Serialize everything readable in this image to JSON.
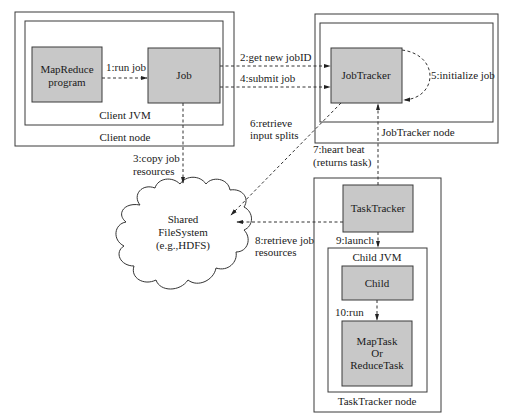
{
  "nodes": {
    "client_node": {
      "label": "Client node"
    },
    "client_jvm": {
      "label": "Client JVM"
    },
    "mapreduce_program": {
      "lines": [
        "MapReduce",
        "program"
      ]
    },
    "job": {
      "label": "Job"
    },
    "jobtracker_node": {
      "label": "JobTracker node"
    },
    "jobtracker": {
      "label": "JobTracker"
    },
    "shared_fs": {
      "lines": [
        "Shared",
        "FileSystem",
        "(e.g.,HDFS)"
      ]
    },
    "tasktracker_node": {
      "label": "TaskTracker node"
    },
    "tasktracker": {
      "label": "TaskTracker"
    },
    "child_jvm": {
      "label": "Child JVM"
    },
    "child": {
      "label": "Child"
    },
    "task": {
      "lines": [
        "MapTask",
        "Or",
        "ReduceTask"
      ]
    }
  },
  "edges": [
    {
      "id": "run-job",
      "from": "mapreduce_program",
      "to": "job",
      "lines": [
        "1:run job"
      ]
    },
    {
      "id": "get-new-jobid",
      "from": "job",
      "to": "jobtracker",
      "lines": [
        "2:get new jobID"
      ]
    },
    {
      "id": "copy-job-resources",
      "from": "job",
      "to": "shared_fs",
      "lines": [
        "3:copy job",
        "resources"
      ]
    },
    {
      "id": "submit-job",
      "from": "job",
      "to": "jobtracker",
      "lines": [
        "4:submit job"
      ]
    },
    {
      "id": "initialize-job",
      "from": "jobtracker",
      "to": "jobtracker",
      "lines": [
        "5:initialize job"
      ]
    },
    {
      "id": "retrieve-input-splits",
      "from": "jobtracker",
      "to": "shared_fs",
      "lines": [
        "6:retrieve",
        "input splits"
      ]
    },
    {
      "id": "heart-beat",
      "from": "tasktracker",
      "to": "jobtracker",
      "lines": [
        "7:heart beat",
        "(returns task)"
      ]
    },
    {
      "id": "retrieve-job-resources",
      "from": "tasktracker",
      "to": "shared_fs",
      "lines": [
        "8:retrieve job",
        "resources"
      ]
    },
    {
      "id": "launch",
      "from": "tasktracker",
      "to": "child",
      "lines": [
        "9:launch"
      ]
    },
    {
      "id": "run",
      "from": "child",
      "to": "task",
      "lines": [
        "10:run"
      ]
    }
  ],
  "colors": {
    "box_fill": "#c8c8c8",
    "stroke": "#3a3a3a"
  }
}
